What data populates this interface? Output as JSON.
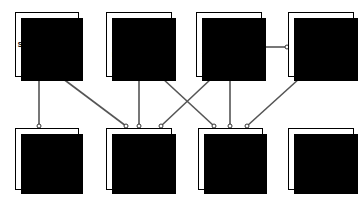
{
  "diagram": {
    "type": "flowchart",
    "canvas": {
      "width": 363,
      "height": 203
    },
    "style": {
      "background": "#ffffff",
      "node_fill": "#ffffff",
      "node_border": "#000000",
      "node_shadow": "#000000",
      "edge_color": "#555555",
      "endpoint_marker": "open-circle"
    },
    "nodes": [
      {
        "id": "SC503",
        "code": "SC503",
        "title_lines": [
          "Switching Theory",
          "& Logic Design"
        ],
        "row": "top",
        "x": 15,
        "y": 12,
        "w": 64,
        "h": 65
      },
      {
        "id": "SC517",
        "code": "SC517",
        "title_lines": [
          "Applications of",
          "Formal Methods"
        ],
        "row": "top",
        "x": 106,
        "y": 12,
        "w": 66,
        "h": 65
      },
      {
        "id": "SC511",
        "code": "SC511",
        "title_lines": [
          "Software",
          "Systems Design"
        ],
        "row": "top",
        "x": 196,
        "y": 12,
        "w": 66,
        "h": 65
      },
      {
        "id": "SC518",
        "code": "SC518",
        "title_lines": [
          "Software",
          "Project",
          "Management"
        ],
        "row": "top",
        "x": 288,
        "y": 12,
        "w": 66,
        "h": 65
      },
      {
        "id": "SC513",
        "code": "SC513",
        "title_lines": [
          "Computer",
          "Architecture"
        ],
        "row": "bottom",
        "x": 15,
        "y": 128,
        "w": 64,
        "h": 62
      },
      {
        "id": "SC714",
        "code": "SC714",
        "title_lines": [
          "The Computer",
          "as a",
          "System",
          "Component"
        ],
        "row": "bottom",
        "x": 106,
        "y": 128,
        "w": 66,
        "h": 62
      },
      {
        "id": "SC912",
        "code": "SC912",
        "title_lines": [
          "Software",
          "Engineering",
          "Project"
        ],
        "row": "bottom",
        "x": 198,
        "y": 128,
        "w": 65,
        "h": 62
      },
      {
        "id": "TECH",
        "code": "",
        "title_lines": [
          "Technical",
          "Electives"
        ],
        "row": "bottom",
        "x": 288,
        "y": 128,
        "w": 66,
        "h": 62
      }
    ],
    "edges": [
      {
        "id": "e1",
        "from": "SC503",
        "to": "SC513",
        "kind": "vertical",
        "x1": 39,
        "y1": 78,
        "x2": 39,
        "y2": 126
      },
      {
        "id": "e2",
        "from": "SC503",
        "to": "SC714",
        "kind": "diagonal",
        "x1": 62,
        "y1": 78,
        "x2": 126,
        "y2": 126
      },
      {
        "id": "e3",
        "from": "SC517",
        "to": "SC714",
        "kind": "vertical",
        "x1": 139,
        "y1": 78,
        "x2": 139,
        "y2": 126
      },
      {
        "id": "e4",
        "from": "SC517",
        "to": "SC912",
        "kind": "diagonal",
        "x1": 162,
        "y1": 78,
        "x2": 214,
        "y2": 126
      },
      {
        "id": "e5",
        "from": "SC511",
        "to": "SC714",
        "kind": "diagonal",
        "x1": 212,
        "y1": 78,
        "x2": 161,
        "y2": 126
      },
      {
        "id": "e6",
        "from": "SC511",
        "to": "SC912",
        "kind": "vertical",
        "x1": 230,
        "y1": 78,
        "x2": 230,
        "y2": 126
      },
      {
        "id": "e7",
        "from": "SC518",
        "to": "SC912",
        "kind": "diagonal",
        "x1": 300,
        "y1": 78,
        "x2": 247,
        "y2": 126
      },
      {
        "id": "e8",
        "from": "SC511",
        "to": "SC518",
        "kind": "horizontal",
        "x1": 263,
        "y1": 47,
        "x2": 287,
        "y2": 47
      }
    ]
  }
}
